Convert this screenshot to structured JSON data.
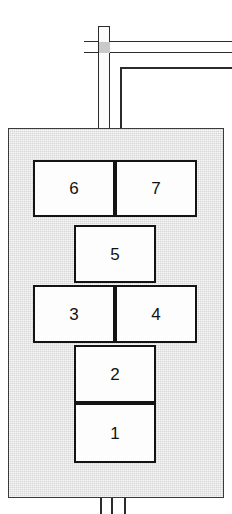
{
  "diagram": {
    "colors": {
      "vessel_fill": "#d6d6d6",
      "vessel_stroke": "#3a3a3a",
      "cell_fill": "#fdfdfd",
      "cell_stroke": "#141414",
      "pipe_stroke": "#2b2b2b",
      "junction_fill": "#c9c9c9",
      "background": "#ffffff"
    },
    "vessel": {
      "name": "vessel-body",
      "x": 8,
      "y": 128,
      "width": 216,
      "height": 370
    },
    "cells": [
      {
        "id": "cell-6",
        "label": "6",
        "x": 33,
        "y": 160,
        "width": 82,
        "height": 57
      },
      {
        "id": "cell-7",
        "label": "7",
        "x": 115,
        "y": 160,
        "width": 82,
        "height": 57
      },
      {
        "id": "cell-5",
        "label": "5",
        "x": 74,
        "y": 225,
        "width": 82,
        "height": 58
      },
      {
        "id": "cell-3",
        "label": "3",
        "x": 33,
        "y": 285,
        "width": 82,
        "height": 58
      },
      {
        "id": "cell-4",
        "label": "4",
        "x": 115,
        "y": 285,
        "width": 82,
        "height": 58
      },
      {
        "id": "cell-2",
        "label": "2",
        "x": 74,
        "y": 345,
        "width": 82,
        "height": 58
      },
      {
        "id": "cell-1",
        "label": "1",
        "x": 74,
        "y": 403,
        "width": 82,
        "height": 60
      }
    ],
    "piping": {
      "top_horizontal_header": {
        "name": "top-horizontal-pipe",
        "x": 84,
        "y": 41,
        "width": 148,
        "height": 12
      },
      "top_vertical_riser": {
        "name": "top-vertical-pipe",
        "x": 98,
        "y": 26,
        "width": 12,
        "height": 102
      },
      "riser_cap": {
        "name": "riser-cap",
        "x": 98,
        "y": 26,
        "width": 12,
        "height": 16
      },
      "branch_line": {
        "name": "branch-line",
        "x": 120,
        "y": 67,
        "width": 112,
        "height": 61
      },
      "bottom_outlet_pipe": {
        "name": "bottom-outlet-pipe",
        "x": 100,
        "y": 498,
        "width": 26,
        "height": 16
      }
    }
  }
}
